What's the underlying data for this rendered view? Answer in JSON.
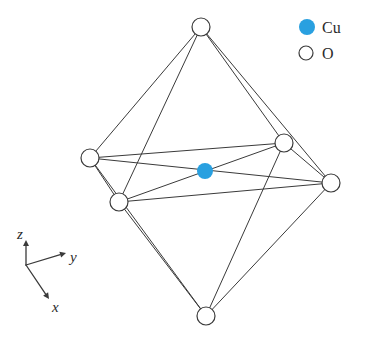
{
  "figure": {
    "background_color": "#ffffff",
    "line_color": "#3a3a3a",
    "cu_color": "#29a0e0",
    "o_fill_color": "#ffffff"
  },
  "legend": {
    "position": "top-right",
    "entries": [
      {
        "icon": "filled-circle-icon",
        "label": "Cu",
        "color": "#29a0e0",
        "marker": "filled",
        "marker_x": 307,
        "marker_y": 27,
        "marker_r": 8,
        "label_x": 322,
        "label_y": 33
      },
      {
        "icon": "open-circle-icon",
        "label": "O",
        "color": "#ffffff",
        "marker": "open",
        "marker_x": 306,
        "marker_y": 53,
        "marker_r": 7,
        "label_x": 322,
        "label_y": 59
      }
    ]
  },
  "axes": {
    "origin_x": 26,
    "origin_y": 265,
    "items": [
      {
        "name": "z",
        "label": "z",
        "tip_x": 26,
        "tip_y": 240,
        "label_x": 17,
        "label_y": 239
      },
      {
        "name": "y",
        "label": "y",
        "tip_x": 66,
        "tip_y": 253,
        "label_x": 70,
        "label_y": 262
      },
      {
        "name": "x",
        "label": "x",
        "tip_x": 49,
        "tip_y": 299,
        "label_x": 52,
        "label_y": 312
      }
    ]
  },
  "structure": {
    "type": "octahedron",
    "central_atom": {
      "element": "Cu",
      "x": 205,
      "y": 171,
      "r": 8,
      "color": "#29a0e0"
    },
    "vertices": [
      {
        "id": "top",
        "element": "O",
        "x": 201,
        "y": 27,
        "r": 9
      },
      {
        "id": "left",
        "element": "O",
        "x": 90,
        "y": 158,
        "r": 9
      },
      {
        "id": "upper-right",
        "element": "O",
        "x": 284,
        "y": 143,
        "r": 9
      },
      {
        "id": "far-right",
        "element": "O",
        "x": 331,
        "y": 183,
        "r": 9
      },
      {
        "id": "lower-left",
        "element": "O",
        "x": 119,
        "y": 202,
        "r": 9
      },
      {
        "id": "bottom",
        "element": "O",
        "x": 206,
        "y": 316,
        "r": 9
      }
    ],
    "edges": [
      [
        "top",
        "left"
      ],
      [
        "top",
        "upper-right"
      ],
      [
        "top",
        "far-right"
      ],
      [
        "top",
        "lower-left"
      ],
      [
        "bottom",
        "left"
      ],
      [
        "bottom",
        "upper-right"
      ],
      [
        "bottom",
        "far-right"
      ],
      [
        "bottom",
        "lower-left"
      ],
      [
        "left",
        "upper-right"
      ],
      [
        "upper-right",
        "far-right"
      ],
      [
        "far-right",
        "lower-left"
      ],
      [
        "lower-left",
        "left"
      ],
      [
        "left",
        "far-right"
      ],
      [
        "upper-right",
        "lower-left"
      ]
    ]
  }
}
